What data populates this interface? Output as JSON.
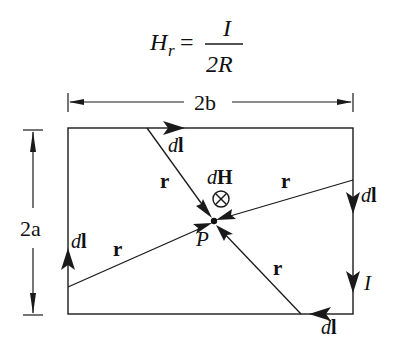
{
  "formula": {
    "lhs": "H",
    "lhs_sub": "r",
    "equals": "=",
    "numerator": "I",
    "denominator": "2R"
  },
  "dimensions": {
    "width_label": "2b",
    "height_label": "2a"
  },
  "labels": {
    "dl_top": [
      "d",
      "l"
    ],
    "dl_right": [
      "d",
      "l"
    ],
    "dl_left": [
      "d",
      "l"
    ],
    "dl_bottom": [
      "d",
      "l"
    ],
    "r_top": "r",
    "r_right": "r",
    "r_left": "r",
    "r_bottom": "r",
    "dH": [
      "d",
      "H"
    ],
    "dH_symbol": "⊗",
    "point": "P",
    "current": "I"
  },
  "colors": {
    "stroke": "#1a1a1a",
    "background": "#ffffff"
  }
}
